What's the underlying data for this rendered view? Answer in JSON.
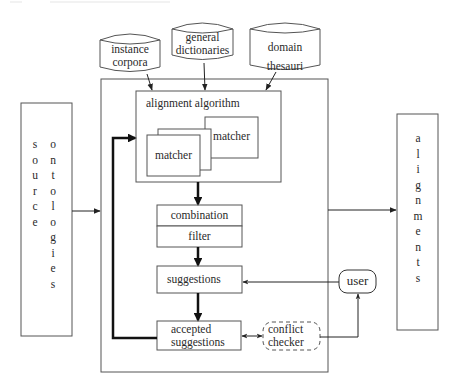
{
  "diagram": {
    "type": "ontology alignment framework",
    "resources": [
      {
        "id": "instance-corpora",
        "label_lines": [
          "instance",
          "corpora"
        ]
      },
      {
        "id": "general-dictionaries",
        "label_lines": [
          "general",
          "dictionaries"
        ]
      },
      {
        "id": "domain-thesauri",
        "label_lines": [
          "domain",
          "thesauri"
        ]
      }
    ],
    "source": {
      "label": "source ontologies",
      "col1": [
        "s",
        "o",
        "u",
        "r",
        "c",
        "e"
      ],
      "col2": [
        "o",
        "n",
        "t",
        "o",
        "l",
        "o",
        "g",
        "i",
        "e",
        "s"
      ]
    },
    "output": {
      "label": "alignments",
      "letters": [
        "a",
        "l",
        "i",
        "g",
        "n",
        "m",
        "e",
        "n",
        "t",
        "s"
      ]
    },
    "alignment_algorithm": {
      "label": "alignment algorithm",
      "matcher_label": "matcher",
      "matchers_visible_labels": 2
    },
    "combination": {
      "label": "combination"
    },
    "filter": {
      "label": "filter"
    },
    "suggestions": {
      "label": "suggestions"
    },
    "accepted_suggestions": {
      "label_lines": [
        "accepted",
        "suggestions"
      ]
    },
    "conflict_checker": {
      "label_lines": [
        "conflict",
        "checker"
      ]
    },
    "user": {
      "label": "user"
    },
    "edges": [
      {
        "from": "instance-corpora",
        "to": "alignment-algorithm"
      },
      {
        "from": "general-dictionaries",
        "to": "alignment-algorithm"
      },
      {
        "from": "domain-thesauri",
        "to": "alignment-algorithm"
      },
      {
        "from": "source-ontologies",
        "to": "framework"
      },
      {
        "from": "framework",
        "to": "alignments"
      },
      {
        "from": "alignment-algorithm",
        "to": "combination",
        "style": "thick"
      },
      {
        "from": "filter",
        "to": "suggestions",
        "style": "thick"
      },
      {
        "from": "suggestions",
        "to": "accepted-suggestions",
        "style": "thick"
      },
      {
        "from": "accepted-suggestions",
        "to": "alignment-algorithm",
        "style": "thick feedback"
      },
      {
        "from": "user",
        "to": "suggestions"
      },
      {
        "from": "accepted-suggestions",
        "to": "conflict-checker",
        "bidirectional": true
      },
      {
        "from": "conflict-checker",
        "to": "user"
      }
    ]
  }
}
